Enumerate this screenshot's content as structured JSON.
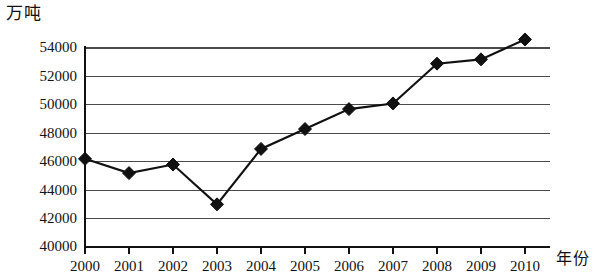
{
  "axes": {
    "y_unit_label": "万吨",
    "x_title": "年份"
  },
  "chart_data": {
    "type": "line",
    "title": "",
    "subtitle": "",
    "xlabel": "年份",
    "ylabel": "万吨",
    "categories": [
      "2000",
      "2001",
      "2002",
      "2003",
      "2004",
      "2005",
      "2006",
      "2007",
      "2008",
      "2009",
      "2010"
    ],
    "values": [
      46200,
      45200,
      45800,
      43000,
      46900,
      48300,
      49700,
      50100,
      52900,
      53200,
      54600
    ],
    "series": [
      {
        "name": "",
        "values": [
          46200,
          45200,
          45800,
          43000,
          46900,
          48300,
          49700,
          50100,
          52900,
          53200,
          54600
        ]
      }
    ],
    "ylim": [
      40000,
      54000
    ],
    "ytick_labels": [
      "40000",
      "42000",
      "44000",
      "46000",
      "48000",
      "50000",
      "52000",
      "54000"
    ],
    "ytick_values": [
      40000,
      42000,
      44000,
      46000,
      48000,
      50000,
      52000,
      54000
    ],
    "xtick_labels": [
      "2000",
      "2001",
      "2002",
      "2003",
      "2004",
      "2005",
      "2006",
      "2007",
      "2008",
      "2009",
      "2010"
    ],
    "grid": true,
    "grid_axis": "y",
    "legend": false,
    "legend_position": "none",
    "marker": "diamond",
    "line_color": "#111111",
    "marker_color": "#111111",
    "grid_color": "#4a4a4a"
  },
  "layout": {
    "plot_left": 85,
    "plot_right": 550,
    "plot_top": 48,
    "plot_bottom": 247,
    "x_step": 44.0
  }
}
